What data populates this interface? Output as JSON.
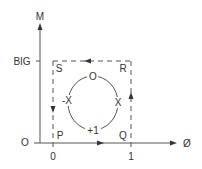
{
  "diagram": {
    "axes": {
      "y_label": "M",
      "x_label": "Ø",
      "origin_label": "O",
      "y_tick_label": "BIG",
      "x_tick_labels": [
        "0",
        "1"
      ]
    },
    "corners": {
      "top_left": "S",
      "top_right": "R",
      "bottom_left": "P",
      "bottom_right": "Q"
    },
    "circle_labels": {
      "top": "O",
      "right": "X",
      "bottom": "+1",
      "left": "-X"
    },
    "cycle_direction": [
      "P→Q (right)",
      "Q→R (up)",
      "R→S (left)",
      "S→P (down)"
    ],
    "colors": {
      "line": "#555555",
      "text": "#333333",
      "background": "#ffffff"
    }
  }
}
